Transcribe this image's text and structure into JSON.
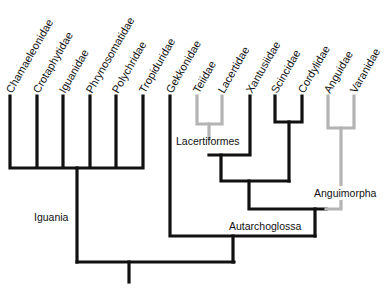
{
  "diagram": {
    "type": "phylogenetic-tree",
    "colors": {
      "primary_branch": "#111111",
      "highlight_branch": "#b4b4b4",
      "background": "#ffffff"
    },
    "taxa": [
      {
        "name": "Chamaeleonidae",
        "x": 10
      },
      {
        "name": "Crotaphytidae",
        "x": 37
      },
      {
        "name": "Iguanidae",
        "x": 63
      },
      {
        "name": "Phrynosomatidae",
        "x": 90
      },
      {
        "name": "Polychridae",
        "x": 116
      },
      {
        "name": "Tropiduridae",
        "x": 143
      },
      {
        "name": "Gekkonidae",
        "x": 170
      },
      {
        "name": "Teiidae",
        "x": 197
      },
      {
        "name": "Lacertidae",
        "x": 222
      },
      {
        "name": "Xantusiidae",
        "x": 250
      },
      {
        "name": "Scincidae",
        "x": 275
      },
      {
        "name": "Cordylidae",
        "x": 302
      },
      {
        "name": "Anguidae",
        "x": 328
      },
      {
        "name": "Varanidae",
        "x": 354
      }
    ],
    "clades": {
      "iguania": "Iguania",
      "lacertiformes": "Lacertiformes",
      "anguimorpha": "Anguimorpha",
      "autarchoglossa": "Autarchoglossa"
    }
  }
}
